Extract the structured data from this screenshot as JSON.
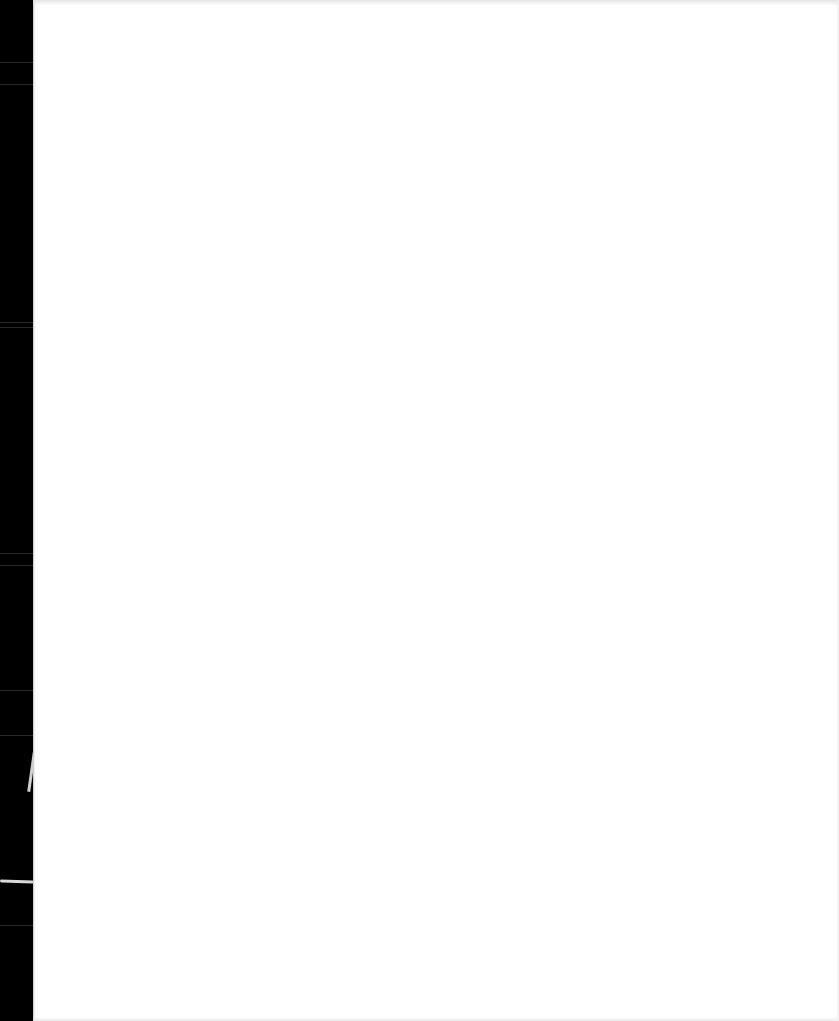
{
  "document": {
    "type": "scanned-page",
    "page_text": "",
    "colors": {
      "page_background": "#ffffff",
      "scanner_edge": "#000000"
    }
  }
}
